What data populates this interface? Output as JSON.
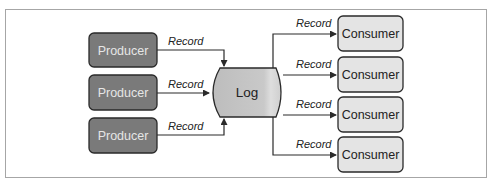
{
  "diagram": {
    "producers": [
      {
        "label": "Producer"
      },
      {
        "label": "Producer"
      },
      {
        "label": "Producer"
      }
    ],
    "log": {
      "label": "Log"
    },
    "consumers": [
      {
        "label": "Consumer"
      },
      {
        "label": "Consumer"
      },
      {
        "label": "Consumer"
      },
      {
        "label": "Consumer"
      }
    ],
    "edges": {
      "producer_to_log": [
        {
          "label": "Record"
        },
        {
          "label": "Record"
        },
        {
          "label": "Record"
        }
      ],
      "log_to_consumer": [
        {
          "label": "Record"
        },
        {
          "label": "Record"
        },
        {
          "label": "Record"
        },
        {
          "label": "Record"
        }
      ]
    },
    "colors": {
      "producer_fill": "#7a7a7a",
      "producer_text": "#e6e6e6",
      "log_fill": "#c4c4c4",
      "consumer_fill": "#e4e4e4",
      "stroke": "#2a2a2a",
      "frame": "#a6a6a6"
    }
  }
}
